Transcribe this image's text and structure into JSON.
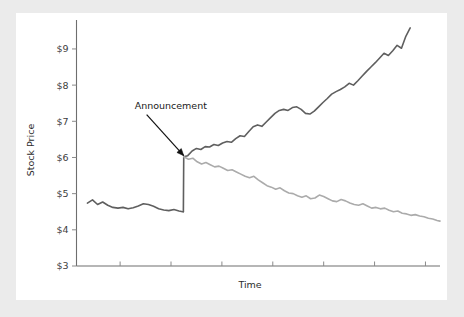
{
  "figure": {
    "background_color": "#ebebeb",
    "plot_background_color": "#ffffff"
  },
  "chart_data": {
    "type": "line",
    "title": "",
    "subtitle": "",
    "xlabel": "Time",
    "ylabel": "Stock Price",
    "ylim": [
      3,
      9.8
    ],
    "xlim": [
      0,
      100
    ],
    "grid": false,
    "legend": null,
    "legend_position": "none",
    "y_tick_labels": [
      "$3",
      "$4",
      "$5",
      "$6",
      "$7",
      "$8",
      "$9"
    ],
    "y_tick_values": [
      3,
      4,
      5,
      6,
      7,
      8,
      9
    ],
    "x_tick_labels": [
      "",
      "",
      "",
      "",
      "",
      "",
      ""
    ],
    "x_tick_values": [
      12,
      26,
      40,
      54,
      68,
      82,
      96
    ],
    "annotations": [
      {
        "text": "Announcement",
        "text_x": 16,
        "text_y": 7.35,
        "arrow_to_x": 29.5,
        "arrow_to_y": 6.05
      }
    ],
    "series": [
      {
        "name": "pre-announcement",
        "color": "#5f5f5f",
        "width": 1.6,
        "x": [
          3.0,
          4.4,
          5.8,
          7.2,
          8.6,
          10.0,
          11.4,
          12.8,
          14.2,
          15.6,
          17.0,
          18.4,
          19.8,
          21.2,
          22.6,
          24.0,
          25.4,
          26.8,
          28.2,
          29.2,
          29.4
        ],
        "values": [
          4.74,
          4.83,
          4.7,
          4.77,
          4.68,
          4.62,
          4.6,
          4.62,
          4.58,
          4.61,
          4.66,
          4.72,
          4.7,
          4.65,
          4.58,
          4.55,
          4.53,
          4.56,
          4.52,
          4.5,
          4.5
        ]
      },
      {
        "name": "announcement-jump",
        "color": "#5f5f5f",
        "width": 1.6,
        "x": [
          29.4,
          29.5
        ],
        "values": [
          4.5,
          6.02
        ]
      },
      {
        "name": "good-news-path",
        "color": "#5f5f5f",
        "width": 1.6,
        "x": [
          29.5,
          30.6,
          31.8,
          33.0,
          34.2,
          35.4,
          36.6,
          37.8,
          39.0,
          40.2,
          41.4,
          42.6,
          43.8,
          45.0,
          46.2,
          47.4,
          48.6,
          49.8,
          51.0,
          52.2,
          53.4,
          54.6,
          55.8,
          57.0,
          58.2,
          59.4,
          60.6,
          61.8,
          63.0,
          64.2,
          65.4,
          66.6,
          67.8,
          69.0,
          70.2,
          71.4,
          72.6,
          73.8,
          75.0,
          76.2,
          77.4,
          78.6,
          79.8,
          81.0,
          82.2,
          83.4,
          84.6,
          85.8,
          87.0,
          88.2,
          89.4,
          90.6,
          91.8
        ],
        "values": [
          6.02,
          6.05,
          6.18,
          6.25,
          6.22,
          6.3,
          6.29,
          6.36,
          6.33,
          6.4,
          6.44,
          6.42,
          6.52,
          6.6,
          6.58,
          6.72,
          6.85,
          6.9,
          6.86,
          6.98,
          7.1,
          7.22,
          7.3,
          7.33,
          7.3,
          7.38,
          7.4,
          7.33,
          7.22,
          7.2,
          7.28,
          7.4,
          7.52,
          7.63,
          7.75,
          7.82,
          7.88,
          7.95,
          8.05,
          8.0,
          8.12,
          8.25,
          8.38,
          8.5,
          8.62,
          8.75,
          8.88,
          8.82,
          8.95,
          9.1,
          9.02,
          9.35,
          9.58
        ]
      },
      {
        "name": "bad-news-path",
        "color": "#ababab",
        "width": 1.6,
        "x": [
          29.5,
          30.8,
          32.0,
          33.2,
          34.4,
          35.6,
          36.8,
          38.0,
          39.2,
          40.4,
          41.6,
          42.8,
          44.0,
          45.2,
          46.4,
          47.6,
          48.8,
          50.0,
          51.2,
          52.4,
          53.6,
          54.8,
          56.0,
          57.2,
          58.4,
          59.6,
          60.8,
          62.0,
          63.2,
          64.4,
          65.6,
          66.8,
          68.0,
          69.2,
          70.4,
          71.6,
          72.8,
          74.0,
          75.2,
          76.4,
          77.6,
          78.8,
          80.0,
          81.2,
          82.4,
          83.6,
          84.8,
          86.0,
          87.2,
          88.4,
          89.6,
          90.8,
          92.0,
          93.2,
          94.4,
          95.6,
          96.8,
          98.0,
          99.2,
          100.0
        ],
        "values": [
          6.02,
          5.95,
          5.98,
          5.88,
          5.82,
          5.86,
          5.8,
          5.74,
          5.76,
          5.7,
          5.64,
          5.66,
          5.6,
          5.54,
          5.48,
          5.44,
          5.48,
          5.38,
          5.3,
          5.22,
          5.18,
          5.12,
          5.16,
          5.08,
          5.02,
          5.0,
          4.94,
          4.9,
          4.94,
          4.86,
          4.88,
          4.96,
          4.92,
          4.86,
          4.8,
          4.78,
          4.84,
          4.8,
          4.74,
          4.7,
          4.68,
          4.72,
          4.66,
          4.6,
          4.62,
          4.58,
          4.6,
          4.54,
          4.5,
          4.52,
          4.46,
          4.44,
          4.4,
          4.42,
          4.38,
          4.36,
          4.32,
          4.3,
          4.26,
          4.24
        ]
      }
    ]
  }
}
